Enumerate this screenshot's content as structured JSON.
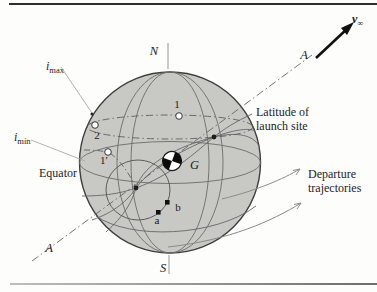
{
  "figure": {
    "poles": {
      "north": "N",
      "south": "S"
    },
    "asymptote": {
      "label_top": "A",
      "label_bottom": "A"
    },
    "v_infinity": {
      "base": "v",
      "sub": "∞"
    },
    "inclination": {
      "base": "i",
      "max_sub": "max",
      "min_sub": "min"
    },
    "equator_label": "Equator",
    "latitude_label": {
      "line1": "Latitude of",
      "line2": "launch site"
    },
    "departure_label": {
      "line1": "Departure",
      "line2": "trajectories"
    },
    "center_label": "G",
    "points": {
      "p1": "1",
      "p2": "2",
      "p1prime": "1′",
      "pa": "a",
      "pb": "b"
    },
    "colors": {
      "sphere_fill": "#c8c8c5",
      "sphere_stroke": "#3e3e3c",
      "grid_curve": "#6b6b69",
      "dash_dot": "#5f5f5d",
      "leader_line": "#a9a9a7",
      "trajectory_arrow": "#8b8b89",
      "ink": "#1c1c1c"
    }
  }
}
